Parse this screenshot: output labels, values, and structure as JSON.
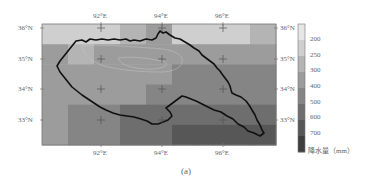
{
  "figure": {
    "caption": "(a)",
    "colorbar_title": "降水量（mm）"
  },
  "axes": {
    "top_ticks": [
      "92°E",
      "94°E",
      "96°E"
    ],
    "bottom_ticks": [
      "92°E",
      "94°E",
      "96°E"
    ],
    "left_ticks": [
      "36°N",
      "35°N",
      "34°N",
      "33°N"
    ],
    "right_ticks": [
      "36°N",
      "35°N",
      "34°N",
      "33°N"
    ]
  },
  "colorbar": {
    "labels": [
      "200",
      "250",
      "300",
      "400",
      "500",
      "600",
      "700"
    ],
    "colors": [
      "#e6e6e6",
      "#cfcfcf",
      "#b4b4b4",
      "#9c9c9c",
      "#858585",
      "#6e6e6e",
      "#575757",
      "#3e3e3e"
    ]
  },
  "chart_data": {
    "type": "heatmap",
    "title": "",
    "subtitle": "(a)",
    "xlabel": "Longitude",
    "ylabel": "Latitude",
    "x_ticks": [
      "92°E",
      "94°E",
      "96°E"
    ],
    "y_ticks": [
      "36°N",
      "35°N",
      "34°N",
      "33°N"
    ],
    "xlim": [
      90.5,
      97.5
    ],
    "ylim": [
      32.5,
      36.2
    ],
    "colorbar": {
      "label": "降水量（mm）",
      "ticks": [
        200,
        250,
        300,
        400,
        500,
        600,
        700
      ],
      "colormap": "grayscale (light = low, dark = high)"
    },
    "grid_columns_lon": [
      91.0,
      91.75,
      92.5,
      93.25,
      94.0,
      94.75,
      95.5,
      96.25,
      97.0
    ],
    "grid_rows_lat": [
      35.8,
      35.2,
      34.6,
      34.0,
      33.4,
      32.8
    ],
    "values_mm_approx": [
      [
        220,
        220,
        220,
        260,
        330,
        200,
        200,
        200,
        260
      ],
      [
        300,
        280,
        320,
        350,
        360,
        370,
        370,
        360,
        370
      ],
      [
        370,
        340,
        300,
        340,
        380,
        420,
        420,
        460,
        400
      ],
      [
        370,
        340,
        330,
        360,
        420,
        420,
        460,
        460,
        480
      ],
      [
        360,
        420,
        450,
        500,
        520,
        520,
        540,
        560,
        560
      ],
      [
        360,
        420,
        480,
        560,
        560,
        600,
        620,
        600,
        640
      ]
    ],
    "overlay": "basin boundary outline (black)"
  }
}
